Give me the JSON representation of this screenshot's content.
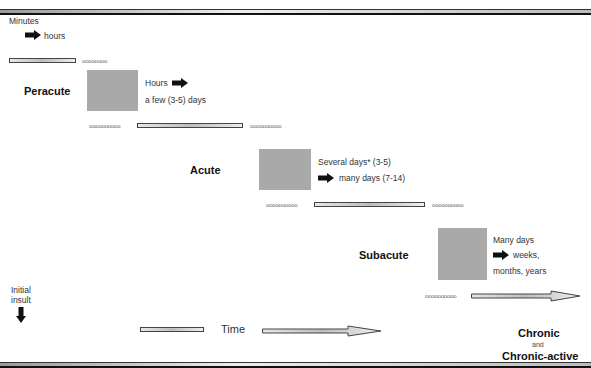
{
  "diagram": {
    "start": {
      "line1": "Minutes",
      "line2": "hours",
      "arrow_icon": "right-arrow-icon"
    },
    "stages": [
      {
        "name": "Peracute",
        "duration_line1": "Hours",
        "duration_line2": "a few (3-5) days"
      },
      {
        "name": "Acute",
        "duration_line1": "Several days* (3-5)",
        "duration_line2": "many days (7-14)"
      },
      {
        "name": "Subacute",
        "duration_line1": "Many days",
        "duration_line2": "weeks,",
        "duration_line3": "months, years"
      }
    ],
    "final": {
      "line1": "Chronic",
      "line2": "and",
      "line3": "Chronic-active"
    },
    "initial_insult": {
      "line1": "Initial",
      "line2": "insult",
      "arrow_icon": "down-arrow-icon"
    },
    "time_axis": {
      "label": "Time"
    },
    "dots": {
      "short": "oooooooo",
      "long": "oooooooooo"
    },
    "colors": {
      "stage_box": "#a9a9a9",
      "arrow": "#111111"
    }
  }
}
